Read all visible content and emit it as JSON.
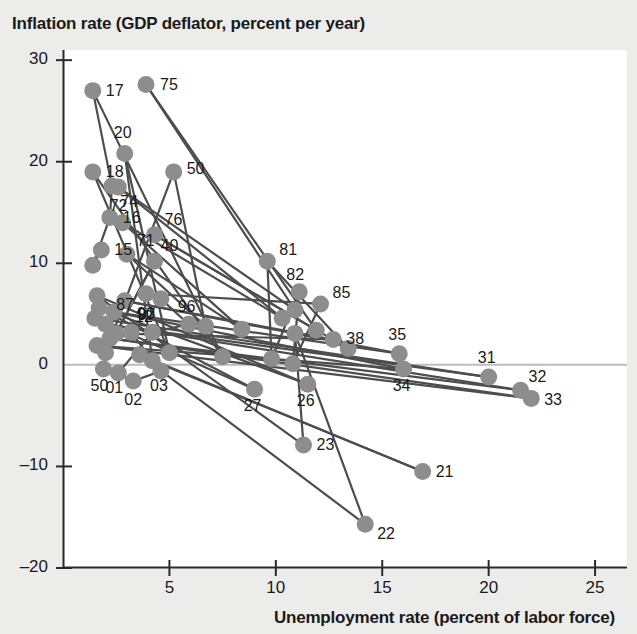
{
  "chart_data": {
    "type": "scatter",
    "title": "",
    "ylabel": "Inflation rate (GDP deflator, percent per year)",
    "xlabel": "Unemployment rate (percent of labor force)",
    "xlim": [
      0,
      26.5
    ],
    "ylim": [
      -20,
      31
    ],
    "xticks": [
      5,
      10,
      15,
      20,
      25
    ],
    "yticks": [
      30,
      20,
      10,
      0,
      -10,
      -20
    ],
    "grid": false,
    "legend": null,
    "zero_line": 0,
    "marker_color": "#8d8d8d",
    "line_color": "#4d4d4d",
    "connected": true,
    "series": [
      {
        "name": "U.S. inflation vs unemployment by year",
        "point_label_field": "label",
        "points": [
          {
            "label": "",
            "x": 1.4,
            "y": 9.8
          },
          {
            "label": "15",
            "x": 1.8,
            "y": 11.3
          },
          {
            "label": "16",
            "x": 2.2,
            "y": 14.5
          },
          {
            "label": "17",
            "x": 1.4,
            "y": 27.0
          },
          {
            "label": "18",
            "x": 1.4,
            "y": 19.0
          },
          {
            "label": "",
            "x": 2.3,
            "y": 17.6
          },
          {
            "label": "20",
            "x": 2.9,
            "y": 20.8
          },
          {
            "label": "21",
            "x": 16.9,
            "y": -10.5
          },
          {
            "label": "22",
            "x": 14.2,
            "y": -15.7
          },
          {
            "label": "23",
            "x": 11.3,
            "y": -7.9
          },
          {
            "label": "",
            "x": 7.5,
            "y": 0.8
          },
          {
            "label": "",
            "x": 5.0,
            "y": 1.2
          },
          {
            "label": "26",
            "x": 11.5,
            "y": -1.9
          },
          {
            "label": "27",
            "x": 9.0,
            "y": -2.4
          },
          {
            "label": "",
            "x": 4.2,
            "y": 0.4
          },
          {
            "label": "",
            "x": 3.6,
            "y": 1.0
          },
          {
            "label": "31",
            "x": 20.0,
            "y": -1.2
          },
          {
            "label": "32",
            "x": 21.5,
            "y": -2.5
          },
          {
            "label": "33",
            "x": 22.0,
            "y": -3.3
          },
          {
            "label": "34",
            "x": 16.0,
            "y": -0.4
          },
          {
            "label": "35",
            "x": 15.8,
            "y": 1.1
          },
          {
            "label": "38",
            "x": 12.7,
            "y": 2.5
          },
          {
            "label": "",
            "x": 10.9,
            "y": 3.1
          },
          {
            "label": "40",
            "x": 4.3,
            "y": 10.2
          },
          {
            "label": "50",
            "x": 5.2,
            "y": 19.0
          },
          {
            "label": "50",
            "x": 1.9,
            "y": -0.4
          },
          {
            "label": "71",
            "x": 3.0,
            "y": 10.9
          },
          {
            "label": "72",
            "x": 2.8,
            "y": 14.0
          },
          {
            "label": "74",
            "x": 2.6,
            "y": 17.5
          },
          {
            "label": "75",
            "x": 3.9,
            "y": 27.6
          },
          {
            "label": "76",
            "x": 4.3,
            "y": 12.8
          },
          {
            "label": "81",
            "x": 9.6,
            "y": 10.2
          },
          {
            "label": "82",
            "x": 11.1,
            "y": 7.2
          },
          {
            "label": "85",
            "x": 12.1,
            "y": 6.0
          },
          {
            "label": "87",
            "x": 3.9,
            "y": 7.0
          },
          {
            "label": "90",
            "x": 4.6,
            "y": 6.5
          },
          {
            "label": "96",
            "x": 5.9,
            "y": 4.0
          },
          {
            "label": "97",
            "x": 4.2,
            "y": 3.2
          },
          {
            "label": "01",
            "x": 2.6,
            "y": -0.8
          },
          {
            "label": "02",
            "x": 3.3,
            "y": -1.6
          },
          {
            "label": "03",
            "x": 4.6,
            "y": -0.6
          },
          {
            "label": "12",
            "x": 3.2,
            "y": 3.2
          },
          {
            "label": "",
            "x": 1.6,
            "y": 6.8
          },
          {
            "label": "",
            "x": 1.7,
            "y": 5.6
          },
          {
            "label": "",
            "x": 1.5,
            "y": 4.6
          },
          {
            "label": "",
            "x": 2.0,
            "y": 4.0
          },
          {
            "label": "",
            "x": 2.2,
            "y": 2.6
          },
          {
            "label": "",
            "x": 1.6,
            "y": 1.9
          },
          {
            "label": "",
            "x": 2.4,
            "y": 5.2
          },
          {
            "label": "",
            "x": 2.9,
            "y": 6.3
          },
          {
            "label": "",
            "x": 2.5,
            "y": 3.1
          },
          {
            "label": "",
            "x": 2.0,
            "y": 1.2
          },
          {
            "label": "",
            "x": 6.7,
            "y": 3.8
          },
          {
            "label": "",
            "x": 8.4,
            "y": 3.5
          },
          {
            "label": "",
            "x": 10.3,
            "y": 4.6
          },
          {
            "label": "",
            "x": 10.9,
            "y": 5.4
          },
          {
            "label": "",
            "x": 11.9,
            "y": 3.4
          },
          {
            "label": "",
            "x": 13.4,
            "y": 1.6
          },
          {
            "label": "",
            "x": 9.8,
            "y": 0.6
          },
          {
            "label": "",
            "x": 10.8,
            "y": 0.1
          }
        ],
        "path_order": [
          "15",
          "16",
          "17",
          "18",
          "20",
          "21",
          "22",
          "23",
          "26",
          "27",
          "31",
          "32",
          "33",
          "34",
          "35",
          "38",
          "40",
          "50",
          "71",
          "72",
          "74",
          "75",
          "76",
          "81",
          "82",
          "85",
          "87",
          "90",
          "96",
          "97",
          "01",
          "02",
          "03",
          "12"
        ]
      }
    ],
    "point_labels_visible": [
      "15",
      "16",
      "17",
      "18",
      "20",
      "21",
      "22",
      "23",
      "26",
      "27",
      "31",
      "32",
      "33",
      "34",
      "35",
      "38",
      "40",
      "50",
      "50",
      "71",
      "72",
      "74",
      "75",
      "76",
      "81",
      "82",
      "85",
      "87",
      "90",
      "96",
      "97",
      "01",
      "02",
      "03",
      "12"
    ]
  },
  "axes": {
    "y_tick_labels": [
      "30",
      "20",
      "10",
      "0",
      "–10",
      "–20"
    ],
    "x_tick_labels": [
      "5",
      "10",
      "15",
      "20",
      "25"
    ],
    "y_title": "Inflation rate (GDP deflator, percent per year)",
    "x_title": "Unemployment rate (percent of labor force)"
  },
  "style": {
    "background": "#ececeb",
    "plot_background": "#ffffff",
    "axis_color": "#2b2b2b",
    "marker_color": "#8d8d8d",
    "line_color": "#4d4d4d",
    "zero_line_color": "#bdbdbd",
    "text_color": "#1a1a1a"
  }
}
